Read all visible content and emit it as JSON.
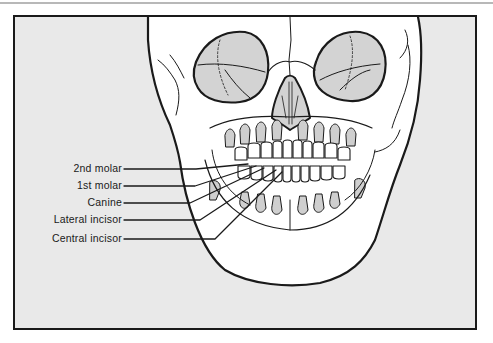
{
  "figure": {
    "labels": [
      {
        "text": "2nd molar",
        "y": 169
      },
      {
        "text": "1st molar",
        "y": 186
      },
      {
        "text": "Canine",
        "y": 203
      },
      {
        "text": "Lateral incisor",
        "y": 220
      },
      {
        "text": "Central incisor",
        "y": 239
      }
    ]
  },
  "colors": {
    "background": "#e9e9e9",
    "bone": "#ffffff",
    "shading": "#cfcfcf",
    "line": "#1a1a1a"
  }
}
